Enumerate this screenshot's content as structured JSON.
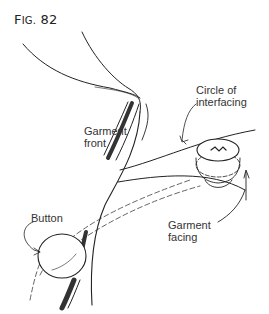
{
  "figure": {
    "title_prefix": "F",
    "title_smallcaps": "IG.",
    "title_number": "82",
    "labels": {
      "garment_front": "Garment\nfront",
      "circle_of_interfacing": "Circle of\ninterfacing",
      "button": "Button",
      "garment_facing": "Garment\nfacing"
    }
  }
}
